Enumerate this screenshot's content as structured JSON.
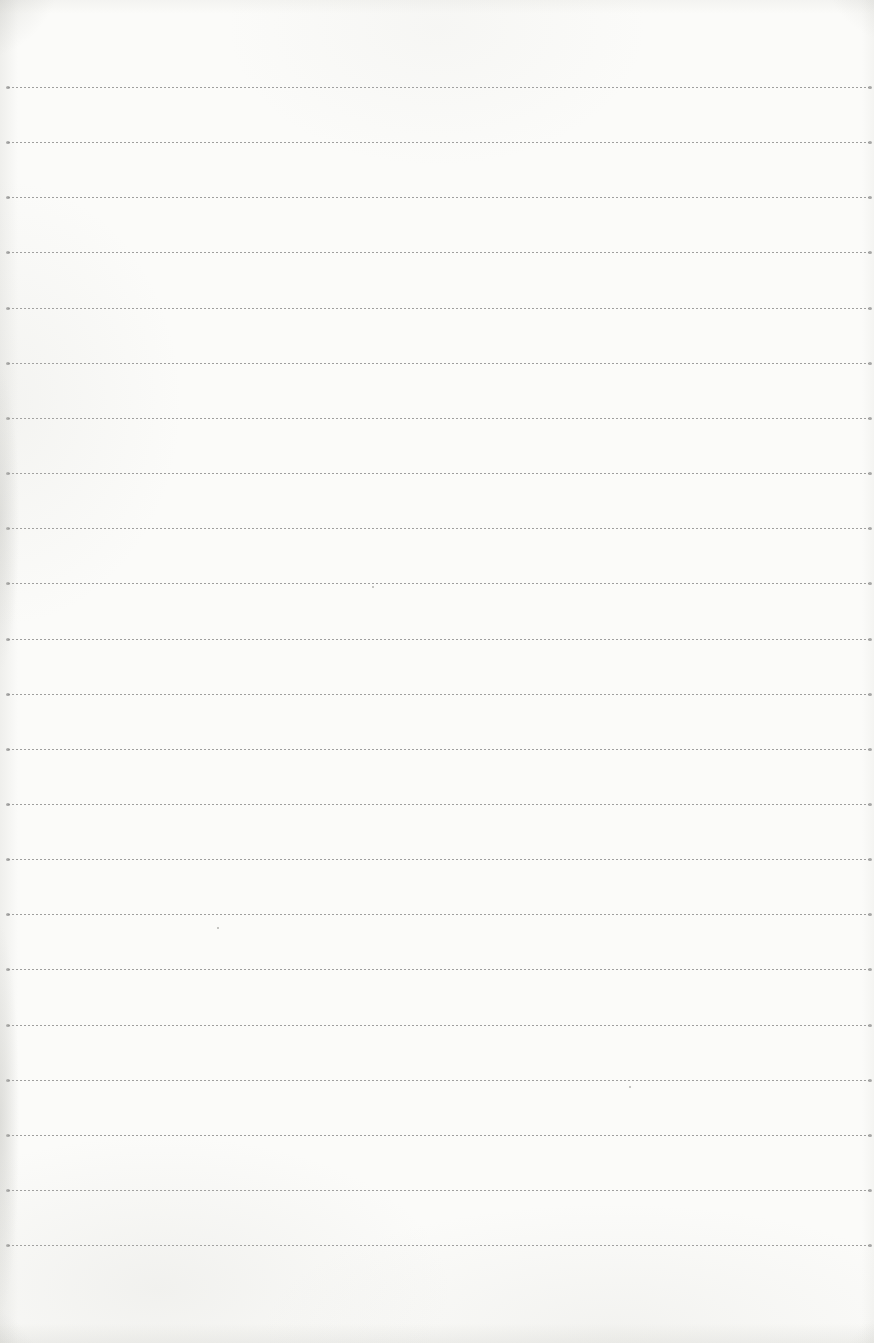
{
  "document": {
    "kind": "scanned-blank-ruled-notebook-page",
    "text_content": "",
    "paper": {
      "background_color": "#fbfbf9",
      "edge_shadow_color": "#c8c8c3"
    },
    "ruling": {
      "line_style": "fine-dashed-horizontal",
      "line_color": "#8f8f8f",
      "line_end_dot_color": "#7a7a7a",
      "line_count": 22,
      "first_line_top_px": 87,
      "line_spacing_px": 55.15,
      "left_inset_px": 8,
      "right_inset_px": 5
    },
    "specks": [
      {
        "x": 372,
        "y": 586
      },
      {
        "x": 217,
        "y": 927
      },
      {
        "x": 629,
        "y": 1086
      }
    ]
  }
}
